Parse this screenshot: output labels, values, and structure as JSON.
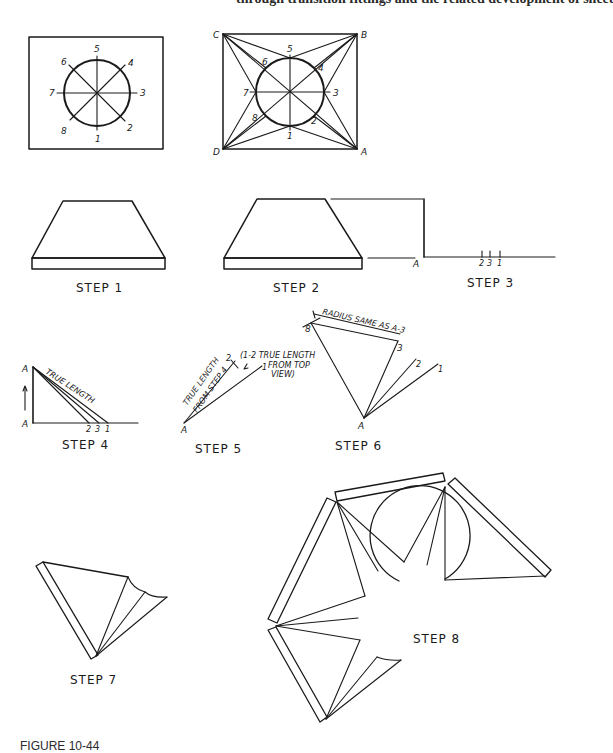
{
  "header": {
    "text": "through transition fittings and the related development of sheet"
  },
  "caption": {
    "text": "FIGURE 10-44"
  },
  "figures": {
    "top_view_1": {
      "points": [
        "1",
        "2",
        "3",
        "4",
        "5",
        "6",
        "7",
        "8"
      ]
    },
    "top_view_2": {
      "points": [
        "1",
        "2",
        "3",
        "4",
        "5",
        "6",
        "7",
        "8"
      ],
      "corners": [
        "A",
        "B",
        "C",
        "D"
      ]
    },
    "step1": {
      "label": "STEP 1"
    },
    "step2": {
      "label": "STEP 2"
    },
    "step3": {
      "label": "STEP 3",
      "point_A": "A",
      "ticks": [
        "2",
        "3",
        "1"
      ]
    },
    "step4": {
      "label": "STEP 4",
      "point_A_top": "A",
      "point_A_bottom": "A",
      "note": "TRUE LENGTH",
      "ticks": [
        "2",
        "3",
        "1"
      ]
    },
    "step5": {
      "label": "STEP 5",
      "point_A": "A",
      "point_1": "1",
      "point_2": "2",
      "note_left_1": "TRUE LENGTH",
      "note_left_2": "FROM STEP 4",
      "note_right_1": "(1-2  TRUE LENGTH",
      "note_right_2": "FROM TOP",
      "note_right_3": "VIEW)"
    },
    "step6": {
      "label": "STEP 6",
      "point_A": "A",
      "point_1": "1",
      "point_2": "2",
      "point_3": "3",
      "point_8": "8",
      "note": "RADIUS SAME AS A-3"
    },
    "step7": {
      "label": "STEP 7"
    },
    "step8": {
      "label": "STEP 8"
    }
  }
}
